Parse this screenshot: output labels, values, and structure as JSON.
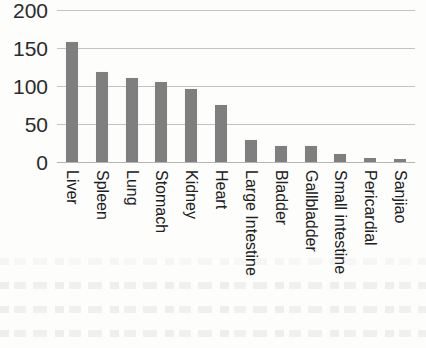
{
  "chart_data": {
    "type": "bar",
    "title": "",
    "subtitle": "",
    "xlabel": "",
    "ylabel": "",
    "ylim": [
      0,
      200
    ],
    "yticks": [
      "0",
      "50",
      "100",
      "150",
      "200"
    ],
    "ytick_values": [
      0,
      50,
      100,
      150,
      200
    ],
    "grid": true,
    "legend": false,
    "legend_position": "none",
    "bar_color": "#7f7f7f",
    "gridline_color": "#b9b9b9",
    "categories": [
      "Liver",
      "Spleen",
      "Lung",
      "Stomach",
      "Kidney",
      "Heart",
      "Large Intestine",
      "Bladder",
      "Gallbladder",
      "Small intestine",
      "Pericardial",
      "Sanjiao"
    ],
    "values": [
      158,
      118,
      110,
      105,
      96,
      75,
      29,
      21,
      21,
      11,
      5,
      4
    ]
  }
}
